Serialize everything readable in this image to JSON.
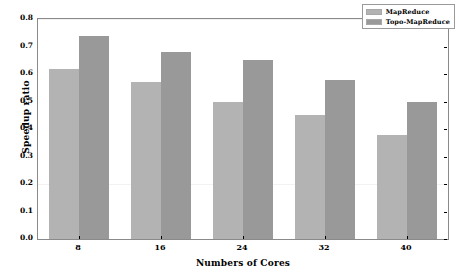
{
  "chart_data": {
    "type": "bar",
    "title": "",
    "xlabel": "Numbers of Cores",
    "ylabel": "Speedup ratio",
    "categories": [
      "8",
      "16",
      "24",
      "32",
      "40"
    ],
    "series": [
      {
        "name": "MapReduce",
        "color": "#b3b3b3",
        "values": [
          0.62,
          0.57,
          0.5,
          0.45,
          0.38
        ]
      },
      {
        "name": "Topo-MapReduce",
        "color": "#999999",
        "values": [
          0.74,
          0.68,
          0.65,
          0.58,
          0.5
        ]
      }
    ],
    "ylim": [
      0.0,
      0.8
    ],
    "yticks": [
      "0.0",
      "0.1",
      "0.2",
      "0.3",
      "0.4",
      "0.5",
      "0.6",
      "0.7",
      "0.8"
    ],
    "ytick_values": [
      0.0,
      0.1,
      0.2,
      0.3,
      0.4,
      0.5,
      0.6,
      0.7,
      0.8
    ],
    "grid": false,
    "legend_position": "upper right"
  }
}
